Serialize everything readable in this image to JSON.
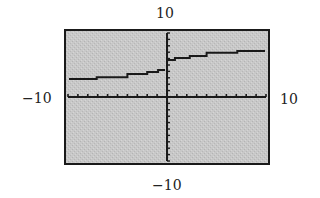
{
  "chart_data": {
    "type": "line",
    "title": "",
    "xlabel": "",
    "ylabel": "",
    "window": {
      "xmin": -10,
      "xmax": 10,
      "ymin": -10,
      "ymax": 10,
      "xscl": 1,
      "yscl": 1
    },
    "xlim": [
      -10,
      10
    ],
    "ylim": [
      -10,
      10
    ],
    "grid": false,
    "legend": null,
    "axis_labels": {
      "top": "10",
      "bottom": "-10",
      "left": "-10",
      "right": "10"
    },
    "series": [
      {
        "name": "step-like increasing curve with jump at x=0",
        "segments": [
          {
            "x": [
              -9.9,
              -7.1
            ],
            "y": 2.8
          },
          {
            "x": [
              -7.1,
              -4.0
            ],
            "y": 3.1
          },
          {
            "x": [
              -4.0,
              -2.0
            ],
            "y": 3.6
          },
          {
            "x": [
              -2.0,
              -0.9
            ],
            "y": 3.9
          },
          {
            "x": [
              -0.9,
              -0.2
            ],
            "y": 4.2
          },
          {
            "x": [
              0.0,
              0.8
            ],
            "y": 5.8
          },
          {
            "x": [
              0.8,
              2.3
            ],
            "y": 6.1
          },
          {
            "x": [
              2.3,
              4.0
            ],
            "y": 6.4
          },
          {
            "x": [
              4.0,
              7.1
            ],
            "y": 6.9
          },
          {
            "x": [
              7.1,
              9.9
            ],
            "y": 7.2
          }
        ]
      }
    ]
  },
  "colors": {
    "screen_background": "#c6c6c6",
    "frame": "#1a1a1a",
    "axes": "#1a1a1a",
    "curve": "#1a1a1a"
  }
}
